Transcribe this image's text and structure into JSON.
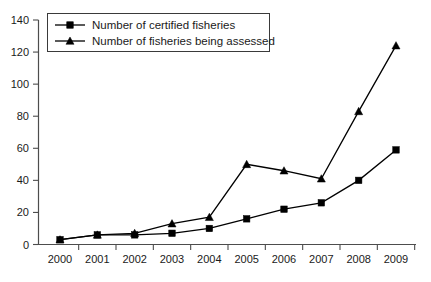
{
  "chart_data": {
    "type": "line",
    "title": "",
    "xlabel": "",
    "ylabel": "",
    "x": [
      2000,
      2001,
      2002,
      2003,
      2004,
      2005,
      2006,
      2007,
      2008,
      2009
    ],
    "categories": [
      "2000",
      "2001",
      "2002",
      "2003",
      "2004",
      "2005",
      "2006",
      "2007",
      "2008",
      "2009"
    ],
    "series": [
      {
        "name": "Number of certified fisheries",
        "marker": "square",
        "values": [
          3,
          6,
          6,
          7,
          10,
          16,
          22,
          26,
          40,
          59
        ]
      },
      {
        "name": "Number of fisheries being assessed",
        "marker": "triangle",
        "values": [
          3,
          6,
          7,
          13,
          17,
          50,
          46,
          41,
          83,
          124
        ]
      }
    ],
    "ylim": [
      0,
      140
    ],
    "yticks": [
      0,
      20,
      40,
      60,
      80,
      100,
      120,
      140
    ],
    "ytick_labels": [
      "0",
      "20",
      "40",
      "60",
      "80",
      "100",
      "120",
      "140"
    ],
    "xlim": [
      2000,
      2009
    ],
    "grid": false,
    "legend_position": "top-left",
    "colors": {
      "series": "#000000",
      "axis": "#4d4d4d",
      "text": "#1a1a1a",
      "background": "#ffffff"
    }
  },
  "legend": {
    "entries": [
      {
        "label": "Number of certified fisheries",
        "marker": "square"
      },
      {
        "label": "Number of fisheries being assessed",
        "marker": "triangle"
      }
    ]
  }
}
